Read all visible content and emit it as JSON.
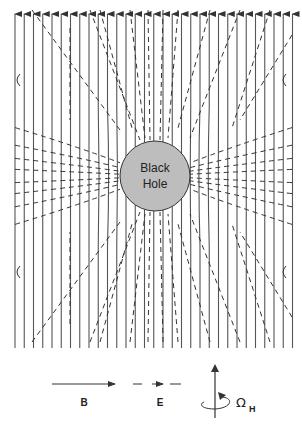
{
  "diagram": {
    "black_hole": {
      "label_line1": "Black",
      "label_line2": "Hole",
      "fill": "#bdbdbd",
      "stroke": "#333333"
    },
    "field_lines": {
      "magnetic": {
        "style": "solid",
        "direction": "up",
        "color": "#444444"
      },
      "electric": {
        "style": "dashed",
        "color": "#333333"
      }
    },
    "legend": {
      "items": [
        {
          "symbol": "solid-arrow",
          "label": "B"
        },
        {
          "symbol": "dashed-arrow",
          "label": "E"
        },
        {
          "symbol": "rotation-axis",
          "label": "Ω",
          "subscript": "H"
        }
      ]
    }
  }
}
